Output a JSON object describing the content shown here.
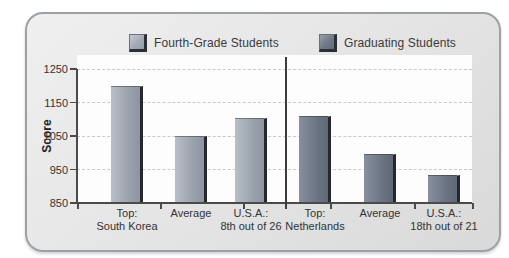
{
  "chart_data": {
    "type": "bar",
    "title": "",
    "ylabel": "Score",
    "ylim": [
      850,
      1250
    ],
    "yticks": [
      1250,
      1150,
      1050,
      950,
      850
    ],
    "grid": "dashed horizontal at 950, 1050, 1150, 1250",
    "legend_position": "top",
    "legend": [
      {
        "label": "Fourth-Grade Students",
        "color": "#9aa2ae"
      },
      {
        "label": "Graduating Students",
        "color": "#6c7583"
      }
    ],
    "series_note": "single value per category; left 3 bars = Fourth-Grade Students, right 3 bars = Graduating Students, separated by vertical divider line",
    "categories": [
      {
        "line1": "Top:",
        "line2": "South Korea",
        "group": "fourth-grade",
        "value": 1200
      },
      {
        "line1": "Average",
        "line2": "",
        "group": "fourth-grade",
        "value": 1050
      },
      {
        "line1": "U.S.A.:",
        "line2": "8th out of 26",
        "group": "fourth-grade",
        "value": 1105
      },
      {
        "line1": "Top:",
        "line2": "Netherlands",
        "group": "graduating",
        "value": 1110
      },
      {
        "line1": "Average",
        "line2": "",
        "group": "graduating",
        "value": 995
      },
      {
        "line1": "U.S.A.:",
        "line2": "18th out of 21",
        "group": "graduating",
        "value": 935
      }
    ]
  },
  "colors": {
    "panel_background": "#e6e6e6",
    "panel_border": "#9ba1a6",
    "plot_background": "#fdfdfd",
    "gridline": "#c9c9c9",
    "axis": "#4a4a4a",
    "bar_edge": "#25282d",
    "text": "#333333"
  }
}
